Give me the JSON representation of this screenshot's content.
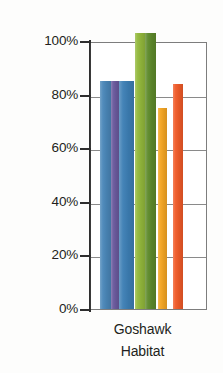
{
  "chart_data": {
    "type": "bar",
    "title": "",
    "xlabel": "Goshawk Habitat",
    "ylabel": "",
    "categories": [
      "Goshawk Habitat"
    ],
    "ylim": [
      0,
      100
    ],
    "y_ticks": [
      0,
      20,
      40,
      60,
      80,
      100
    ],
    "y_ticklabels": [
      "0%",
      "20%",
      "40%",
      "60%",
      "80%",
      "100%"
    ],
    "grid": true,
    "legend": "none",
    "series": [
      {
        "name": "series-1",
        "values": [
          85
        ],
        "color": "#4a87b9"
      },
      {
        "name": "series-2",
        "values": [
          85
        ],
        "color": "#6b5a9e"
      },
      {
        "name": "series-3",
        "values": [
          85
        ],
        "color": "#3d7fb5"
      },
      {
        "name": "series-4",
        "values": [
          103
        ],
        "color": "#93b93c"
      },
      {
        "name": "series-5",
        "values": [
          103
        ],
        "color": "#5e8a2b"
      },
      {
        "name": "series-6",
        "values": [
          75
        ],
        "color": "#f5a623"
      },
      {
        "name": "series-7",
        "values": [
          84
        ],
        "color": "#f05a28"
      }
    ]
  },
  "axis": {
    "y_labels": [
      {
        "text": "100%",
        "value": 100
      },
      {
        "text": "80%",
        "value": 80
      },
      {
        "text": "60%",
        "value": 60
      },
      {
        "text": "40%",
        "value": 40
      },
      {
        "text": "20%",
        "value": 20
      },
      {
        "text": "0%",
        "value": 0
      }
    ]
  },
  "x_axis": {
    "lines": [
      "Goshawk",
      "Habitat"
    ]
  }
}
